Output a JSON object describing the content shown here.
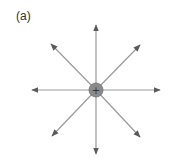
{
  "figure": {
    "label": "(a)",
    "charge": {
      "sign": "+",
      "cx": 96,
      "cy": 90,
      "r": 7,
      "fill": "#8a8a8a",
      "stroke": "#6e6e6e"
    },
    "field_lines": [
      {
        "direction": "up",
        "x2": 96,
        "y2": 25
      },
      {
        "direction": "up-right",
        "x2": 140,
        "y2": 45
      },
      {
        "direction": "right",
        "x2": 160,
        "y2": 90
      },
      {
        "direction": "down-right",
        "x2": 140,
        "y2": 137
      },
      {
        "direction": "down",
        "x2": 96,
        "y2": 154
      },
      {
        "direction": "down-left",
        "x2": 52,
        "y2": 136
      },
      {
        "direction": "left",
        "x2": 32,
        "y2": 90
      },
      {
        "direction": "up-left",
        "x2": 51,
        "y2": 44
      }
    ],
    "line_color": "#9a9a9a",
    "arrow_color": "#5a5a5a"
  }
}
